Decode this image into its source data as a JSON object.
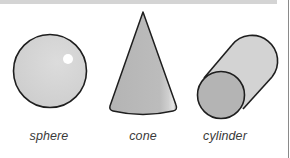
{
  "figure": {
    "shapes": [
      {
        "id": "sphere",
        "label": "sphere"
      },
      {
        "id": "cone",
        "label": "cone"
      },
      {
        "id": "cylinder",
        "label": "cylinder"
      }
    ]
  },
  "colors": {
    "fill_light": "#d2d2d2",
    "fill_mid": "#bdbdbd",
    "fill_dark": "#a9a9a9",
    "outline": "#1e1e1e",
    "highlight": "#ffffff",
    "label_text": "#3a3a3a",
    "band": "#d4d4d4"
  }
}
